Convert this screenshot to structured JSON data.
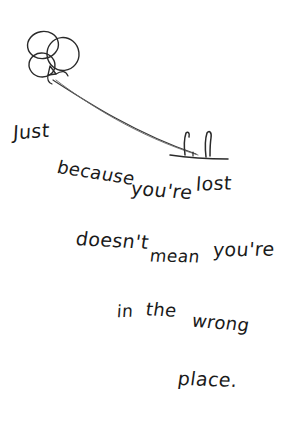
{
  "image": {
    "kind": "handwritten-quote-illustration",
    "background_color": "#ffffff",
    "ink_color": "#1a1a1a",
    "width": 283,
    "height": 440
  },
  "illustration": {
    "subject": "balloon-bunch-on-string",
    "balloon_count": 3,
    "has_knot": true,
    "has_string": true,
    "string_style": "double-stroke-curve",
    "ground_line": true,
    "figure_strokes": 2
  },
  "quote": {
    "full_text": "Just because you're lost doesn't mean you're in the wrong place.",
    "lines": [
      {
        "id": "line-1",
        "text": "Just because you're lost"
      },
      {
        "id": "line-2",
        "text": "doesn't mean you're"
      },
      {
        "id": "line-3",
        "text": "in the wrong"
      },
      {
        "id": "line-4",
        "text": "place."
      }
    ],
    "words": {
      "just": "Just",
      "because": "because",
      "youre_1": "you're",
      "lost": "lost",
      "doesnt": "doesn't",
      "mean": "mean",
      "youre_2": "you're",
      "in": "in",
      "the": "the",
      "wrong": "wrong",
      "place": "place."
    }
  }
}
